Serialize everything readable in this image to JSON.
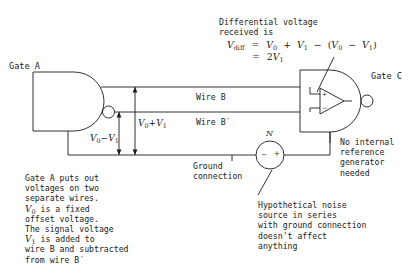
{
  "figure": {
    "title_gate_a": "Gate A",
    "title_gate_c": "Gate C",
    "wire_b_label": "Wire B",
    "wire_b_prime_label": "Wire B′",
    "noise_source_label": "N",
    "noise_minus": "−",
    "noise_plus": "+",
    "opamp_plus": "+",
    "opamp_minus": "−"
  },
  "formula": {
    "intro_line1": "Differential voltage",
    "intro_line2": "received is",
    "line1": {
      "lhs": "V",
      "lhs_sub": "diff",
      "eq": "=",
      "t1": "V",
      "t1_sub": "0",
      "plus": "+",
      "t2": "V",
      "t2_sub": "1",
      "minus": "−",
      "open": "(",
      "t3": "V",
      "t3_sub": "0",
      "minus2": "−",
      "t4": "V",
      "t4_sub": "1",
      "close": ")"
    },
    "line2": {
      "eq": "=",
      "coef": "2",
      "sym": "V",
      "sub": "1"
    }
  },
  "voltage_labels": {
    "inner": {
      "v": "V",
      "sub0": "0",
      "op": "+",
      "v2": "V",
      "sub1": "1"
    },
    "outer": {
      "v": "V",
      "sub0": "0",
      "op": "−",
      "v2": "V",
      "sub1": "1"
    }
  },
  "annotations": {
    "ground_connection": "Ground\nconnection",
    "no_internal_reference": "No internal\nreference\ngenerator\nneeded",
    "hypothetical_noise": "Hypothetical noise\nsource in series\nwith ground connection\ndoesn't affect\nanything",
    "gate_a_description_lines": [
      "Gate A puts out",
      "voltages on two",
      "separate wires."
    ],
    "gate_a_desc_v0_line_pre": "",
    "gate_a_desc_v0_line_post": " is a fixed",
    "gate_a_desc_offset": "offset voltage.",
    "gate_a_desc_signal": "The signal voltage",
    "gate_a_desc_v1_post": " is added to",
    "gate_a_desc_tail1": "wire B and subtracted",
    "gate_a_desc_tail2": "from wire B′"
  },
  "style": {
    "stroke": "#1a1a1a",
    "background": "#ffffff"
  }
}
